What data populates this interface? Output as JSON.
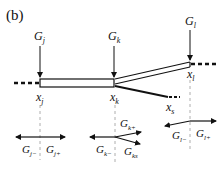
{
  "panel_label": "(b)",
  "forces_top": {
    "gj": {
      "base": "G",
      "sub": "j"
    },
    "gk": {
      "base": "G",
      "sub": "k"
    },
    "gl": {
      "base": "G",
      "sub": "l"
    }
  },
  "nodes": {
    "xj": {
      "base": "x",
      "sub": "j"
    },
    "xk": {
      "base": "x",
      "sub": "k"
    },
    "xl": {
      "base": "x",
      "sub": "l"
    },
    "xs": {
      "base": "x",
      "sub": "s"
    }
  },
  "forces_bottom": {
    "gj_minus": {
      "base": "G",
      "sub": "j−"
    },
    "gj_plus": {
      "base": "G",
      "sub": "j+"
    },
    "gk_minus": {
      "base": "G",
      "sub": "k−"
    },
    "gk_plus": {
      "base": "G",
      "sub": "k+"
    },
    "gks": {
      "base": "G",
      "sub": "ks"
    },
    "gl_minus": {
      "base": "G",
      "sub": "l−"
    },
    "gl_plus": {
      "base": "G",
      "sub": "l+"
    }
  },
  "colors": {
    "ink": "#111111",
    "dash": "#999999"
  }
}
